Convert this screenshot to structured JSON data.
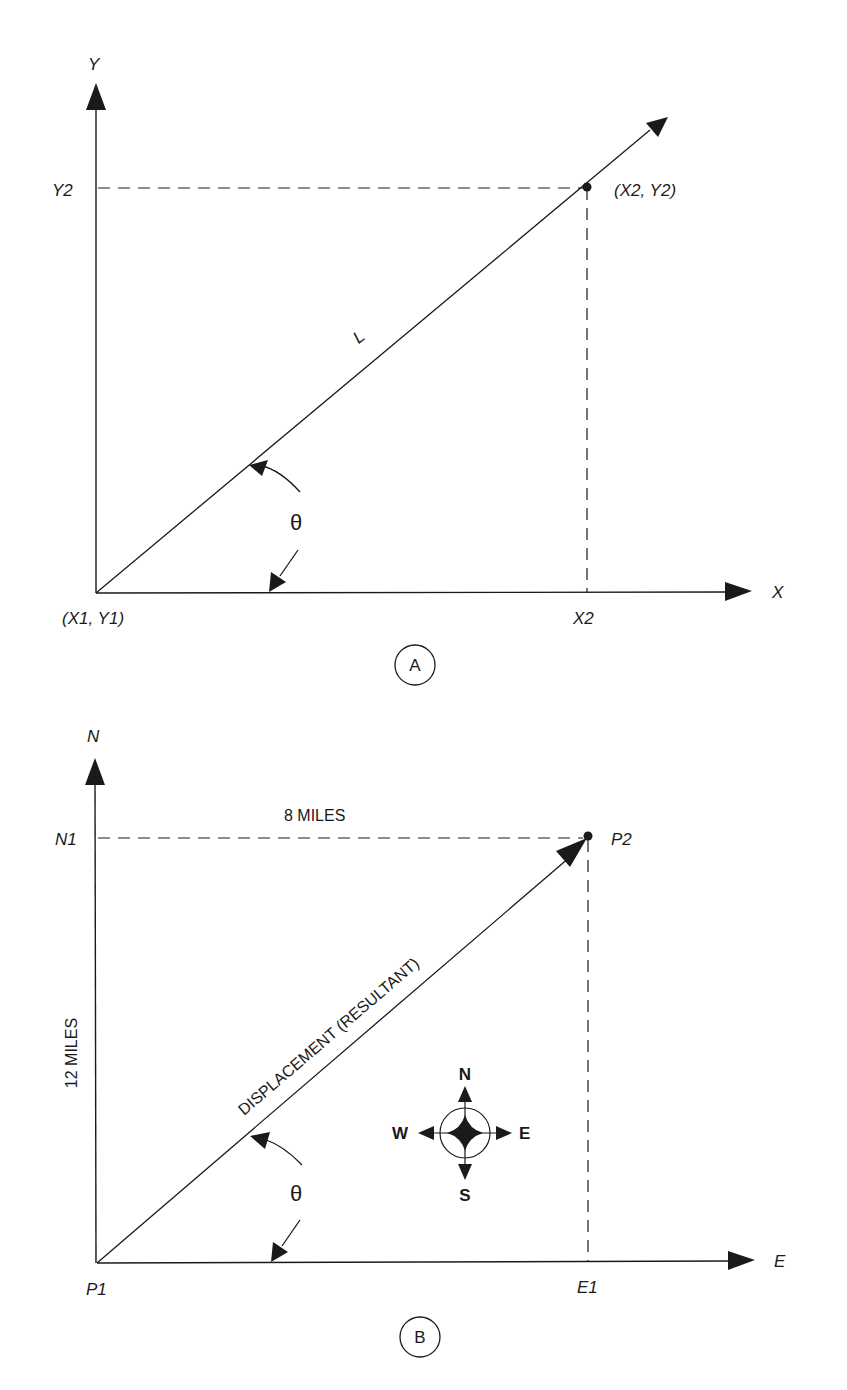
{
  "figure": {
    "panel_a": {
      "label": "A",
      "y_axis_label": "Y",
      "x_axis_label": "X",
      "y2_label": "Y2",
      "x2_label": "X2",
      "origin_label": "(X1, Y1)",
      "point_label": "(X2, Y2)",
      "line_label": "L",
      "angle_label": "θ"
    },
    "panel_b": {
      "label": "B",
      "y_axis_label": "N",
      "x_axis_label": "E",
      "n1_label": "N1",
      "e1_label": "E1",
      "origin_label": "P1",
      "point_label": "P2",
      "horizontal_distance": "8 MILES",
      "vertical_distance": "12 MILES",
      "vector_label": "DISPLACEMENT (RESULTANT)",
      "angle_label": "θ",
      "compass": {
        "north": "N",
        "south": "S",
        "east": "E",
        "west": "W"
      }
    }
  }
}
